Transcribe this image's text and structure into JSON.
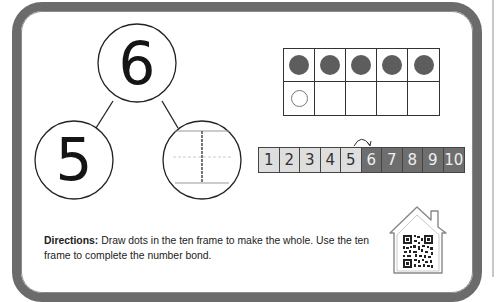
{
  "number_bond": {
    "whole": "6",
    "part_left": "5",
    "part_right": ""
  },
  "ten_frame": {
    "cells": [
      "filled",
      "filled",
      "filled",
      "filled",
      "filled",
      "empty-outline",
      "blank",
      "blank",
      "blank",
      "blank"
    ]
  },
  "number_strip": {
    "numbers": [
      "1",
      "2",
      "3",
      "4",
      "5",
      "6",
      "7",
      "8",
      "9",
      "10"
    ],
    "shaded_from": "6",
    "arrow": "hop from 5 to 6"
  },
  "directions": {
    "label": "Directions:",
    "text": " Draw dots in the ten frame to make the whole. Use the ten frame to complete the number bond."
  },
  "home_icon": {
    "name": "house-qr-code-icon"
  },
  "colors": {
    "border": "#6b6b6b",
    "dot": "#5d5d5d",
    "strip_light": "#dedede",
    "strip_dark": "#6e6e6e"
  }
}
